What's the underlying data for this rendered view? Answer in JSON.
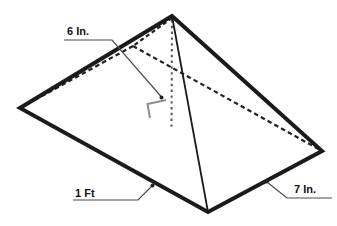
{
  "figure": {
    "type": "rectangular-pyramid-diagram",
    "labels": {
      "height": "6 In.",
      "base_length": "1 Ft",
      "base_width": "7 In."
    },
    "colors": {
      "edge": "#1b1b1b",
      "hidden_edge": "#222222",
      "altitude": "#555555",
      "right_angle_mark": "#8c8c8c",
      "leader": "#4a4a4a",
      "label_text": "#111111",
      "background": "#ffffff"
    }
  }
}
